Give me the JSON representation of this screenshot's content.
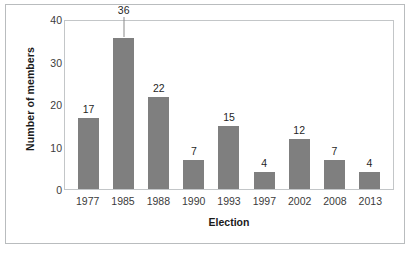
{
  "chart_data": {
    "type": "bar",
    "title": "",
    "subtitle": "",
    "xlabel": "Election",
    "ylabel": "Number of members",
    "categories": [
      "1977",
      "1985",
      "1988",
      "1990",
      "1993",
      "1997",
      "2002",
      "2008",
      "2013"
    ],
    "values": [
      17,
      36,
      22,
      7,
      15,
      4,
      12,
      7,
      4
    ],
    "value_labels": [
      "17",
      "36",
      "22",
      "7",
      "15",
      "4",
      "12",
      "7",
      "4"
    ],
    "ylim": [
      0,
      40
    ],
    "yticks": [
      0,
      10,
      20,
      30,
      40
    ],
    "ytick_labels": [
      "0",
      "10",
      "20",
      "30",
      "40"
    ],
    "grid": false,
    "legend": false,
    "legend_position": "none",
    "bar_color": "#7f7f7f",
    "plot_border_color": "#c3c6c8",
    "frame_border_color": "#b9bcbe",
    "background_color": "#ffffff",
    "label_text_color": "#1f1f1f",
    "axis_text_color": "#3b3b3b",
    "annotations": [
      {
        "category": "1985",
        "kind": "connector-line",
        "description": "thin vertical line linking the 36 data label to the bar top"
      }
    ]
  }
}
